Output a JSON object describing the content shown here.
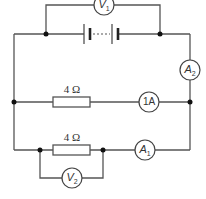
{
  "diagram": {
    "type": "electric circuit",
    "components": {
      "voltmeter_1": {
        "symbol": "V",
        "subscript": "1",
        "position": "across battery"
      },
      "battery": {
        "symbol": "multi-cell battery"
      },
      "ammeter_2": {
        "symbol": "A",
        "subscript": "2",
        "position": "main circuit, right side"
      },
      "resistor_upper": {
        "label": "4 Ω"
      },
      "ammeter_upper": {
        "label": "1A"
      },
      "resistor_lower": {
        "label": "4 Ω"
      },
      "ammeter_1": {
        "symbol": "A",
        "subscript": "1",
        "position": "lower branch"
      },
      "voltmeter_2": {
        "symbol": "V",
        "subscript": "2",
        "position": "across lower resistor"
      }
    }
  }
}
